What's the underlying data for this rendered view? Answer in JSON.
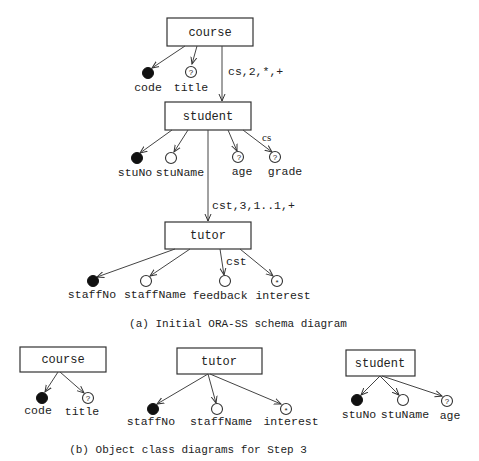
{
  "diagram_a": {
    "caption": "(a) Initial ORA-SS schema diagram",
    "objects": {
      "course": {
        "label": "course"
      },
      "student": {
        "label": "student"
      },
      "tutor": {
        "label": "tutor"
      }
    },
    "relationships": [
      {
        "from": "course",
        "to": "student",
        "label": "cs,2,*,+"
      },
      {
        "from": "student",
        "to": "tutor",
        "label": "cst,3,1..1,+"
      }
    ],
    "attributes": {
      "course": [
        {
          "name": "code",
          "type": "key",
          "marker": ""
        },
        {
          "name": "title",
          "type": "optional",
          "marker": "?"
        }
      ],
      "student": [
        {
          "name": "stuNo",
          "type": "key",
          "marker": ""
        },
        {
          "name": "stuName",
          "type": "required",
          "marker": ""
        },
        {
          "name": "age",
          "type": "optional",
          "marker": "?"
        },
        {
          "name": "grade",
          "type": "optional",
          "marker": "?",
          "rel_label": "cs"
        }
      ],
      "tutor": [
        {
          "name": "staffNo",
          "type": "key",
          "marker": ""
        },
        {
          "name": "staffName",
          "type": "required",
          "marker": ""
        },
        {
          "name": "feedback",
          "type": "required",
          "marker": "",
          "rel_label": "cst"
        },
        {
          "name": "interest",
          "type": "multivalued",
          "marker": "*"
        }
      ]
    }
  },
  "diagram_b": {
    "caption": "(b) Object class diagrams for Step 3",
    "classes": [
      {
        "label": "course",
        "attributes": [
          {
            "name": "code",
            "type": "key",
            "marker": ""
          },
          {
            "name": "title",
            "type": "optional",
            "marker": "?"
          }
        ]
      },
      {
        "label": "tutor",
        "attributes": [
          {
            "name": "staffNo",
            "type": "key",
            "marker": ""
          },
          {
            "name": "staffName",
            "type": "required",
            "marker": ""
          },
          {
            "name": "interest",
            "type": "multivalued",
            "marker": "*"
          }
        ]
      },
      {
        "label": "student",
        "attributes": [
          {
            "name": "stuNo",
            "type": "key",
            "marker": ""
          },
          {
            "name": "stuName",
            "type": "required",
            "marker": ""
          },
          {
            "name": "age",
            "type": "optional",
            "marker": "?"
          }
        ]
      }
    ]
  }
}
